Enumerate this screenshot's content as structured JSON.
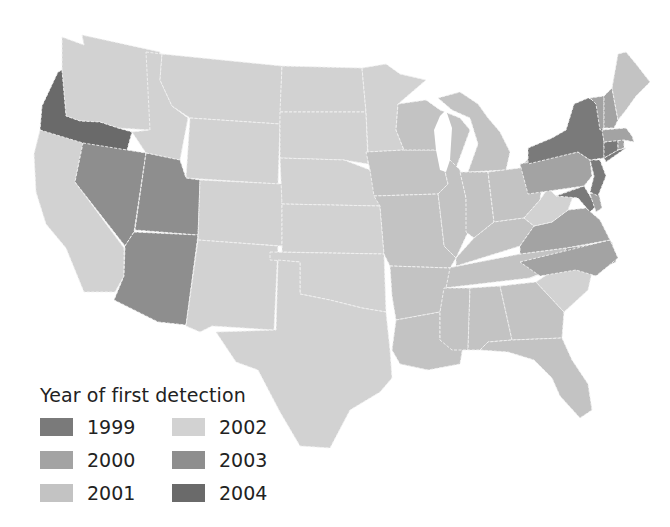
{
  "legend": {
    "title": "Year of first detection",
    "items": [
      {
        "year": "1999",
        "color": "#7a7a7a"
      },
      {
        "year": "2000",
        "color": "#a3a3a3"
      },
      {
        "year": "2001",
        "color": "#c3c3c3"
      },
      {
        "year": "2002",
        "color": "#d2d2d2"
      },
      {
        "year": "2003",
        "color": "#8e8e8e"
      },
      {
        "year": "2004",
        "color": "#6a6a6a"
      }
    ]
  },
  "map_data": {
    "type": "choropleth",
    "region": "Contiguous United States",
    "variable": "Year of first detection",
    "states": {
      "1999": [
        "New York",
        "New Jersey",
        "Connecticut",
        "Maryland"
      ],
      "2000": [
        "Pennsylvania",
        "Vermont",
        "New Hampshire",
        "Massachusetts",
        "Rhode Island",
        "Delaware",
        "Virginia",
        "North Carolina"
      ],
      "2001": [
        "Wisconsin",
        "Iowa",
        "Illinois",
        "Indiana",
        "Ohio",
        "Michigan",
        "Missouri",
        "Kentucky",
        "Tennessee",
        "Arkansas",
        "Louisiana",
        "Mississippi",
        "Alabama",
        "Georgia",
        "Florida",
        "Maine"
      ],
      "2002": [
        "Washington",
        "Idaho",
        "Montana",
        "Wyoming",
        "North Dakota",
        "South Dakota",
        "Nebraska",
        "Kansas",
        "Oklahoma",
        "Texas",
        "New Mexico",
        "Colorado",
        "California",
        "Minnesota",
        "West Virginia",
        "South Carolina"
      ],
      "2003": [
        "Nevada",
        "Utah",
        "Arizona"
      ],
      "2004": [
        "Oregon"
      ]
    }
  }
}
